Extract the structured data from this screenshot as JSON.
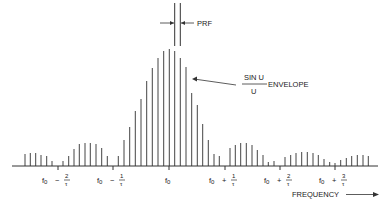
{
  "chart_data": {
    "type": "bar",
    "title": "",
    "xlabel": "FREQUENCY",
    "ylabel": "",
    "annotations": {
      "prf": "PRF",
      "envelope_num": "SIN U",
      "envelope_den": "U",
      "envelope_label": "ENVELOPE"
    },
    "tick_labels": [
      {
        "base": "f",
        "sub": "0",
        "op": "−",
        "num": "2",
        "den": "τ",
        "x": 58
      },
      {
        "base": "f",
        "sub": "0",
        "op": "−",
        "num": "1",
        "den": "τ",
        "x": 113
      },
      {
        "base": "f",
        "sub": "0",
        "op": "",
        "num": "",
        "den": "",
        "x": 169
      },
      {
        "base": "f",
        "sub": "0",
        "op": "+",
        "num": "1",
        "den": "τ",
        "x": 225
      },
      {
        "base": "f",
        "sub": "0",
        "op": "+",
        "num": "2",
        "den": "τ",
        "x": 280
      },
      {
        "base": "f",
        "sub": "0",
        "op": "+",
        "num": "3",
        "den": "τ",
        "x": 335
      }
    ],
    "baseline_y": 166,
    "lines_x": [
      25,
      30.3,
      35.7,
      41,
      46.7,
      52,
      63,
      68.7,
      74,
      79.3,
      85,
      90.3,
      96,
      101.7,
      107.3,
      118.3,
      124,
      129.7,
      135.3,
      141,
      146.7,
      152.3,
      158,
      163.7,
      169.3,
      174.7,
      180.3,
      186,
      191.7,
      197.3,
      202.7,
      208.3,
      214,
      219.3,
      230,
      235.3,
      240.7,
      246.3,
      252,
      257.3,
      263,
      268.3,
      274,
      285,
      290.7,
      296,
      301.7,
      307.3,
      313,
      318.3,
      324,
      329.7,
      335,
      340.7,
      346.3,
      351.7,
      357.3,
      363,
      368.3
    ],
    "values": [
      12,
      13,
      13,
      11,
      10,
      5,
      5,
      10,
      17,
      22,
      23,
      23,
      22,
      18,
      10,
      10,
      26,
      39,
      55,
      67,
      85,
      98,
      108,
      115,
      117,
      115,
      108,
      99,
      73,
      61,
      42,
      26,
      12,
      10,
      18,
      21,
      23,
      23,
      21,
      16,
      11,
      4,
      5,
      9,
      11,
      13,
      14,
      14,
      13,
      11,
      7,
      4,
      3,
      6,
      8,
      10,
      11,
      11,
      10
    ],
    "ylim": [
      0,
      120
    ]
  }
}
